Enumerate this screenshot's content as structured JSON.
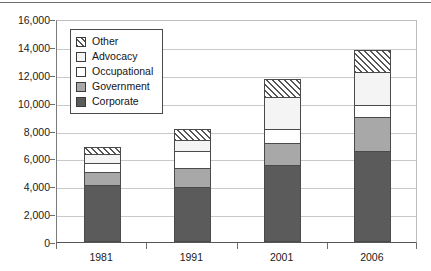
{
  "chart_data": {
    "type": "bar",
    "subtype": "stacked-vertical",
    "title": "",
    "subtitle": "",
    "xlabel": "",
    "ylabel": "",
    "categories": [
      "1981",
      "1991",
      "2001",
      "2006"
    ],
    "ylim": [
      0,
      16000
    ],
    "ytick_values": [
      0,
      2000,
      4000,
      6000,
      8000,
      10000,
      12000,
      14000,
      16000
    ],
    "ytick_labels": [
      "0",
      "2,000",
      "4,000",
      "6,000",
      "8,000",
      "10,000",
      "12,000",
      "14,000",
      "16,000"
    ],
    "grid": true,
    "grid_axis": "y",
    "legend_position": "upper-left-inside",
    "stack_order_bottom_to_top": [
      "Corporate",
      "Government",
      "Occupational",
      "Advocacy",
      "Other"
    ],
    "series": [
      {
        "name": "Corporate",
        "pattern": "solid",
        "color": "#5b5b5b",
        "values": [
          4100,
          3950,
          5500,
          6500
        ]
      },
      {
        "name": "Government",
        "pattern": "solid",
        "color": "#a8a8a8",
        "values": [
          900,
          1350,
          1600,
          2500
        ]
      },
      {
        "name": "Occupational",
        "pattern": "solid",
        "color": "#ffffff",
        "values": [
          700,
          1250,
          1000,
          800
        ]
      },
      {
        "name": "Advocacy",
        "pattern": "solid",
        "color": "#f4f4f4",
        "values": [
          600,
          800,
          2300,
          2400
        ]
      },
      {
        "name": "Other",
        "pattern": "diagonal-hatch",
        "color": "#ffffff",
        "values": [
          500,
          750,
          1300,
          1600
        ]
      }
    ],
    "totals": [
      6800,
      8100,
      11700,
      13800
    ]
  },
  "legend": {
    "items": [
      {
        "label": "Other",
        "swatch": "other-swatch"
      },
      {
        "label": "Advocacy",
        "swatch": "advocacy-swatch"
      },
      {
        "label": "Occupational",
        "swatch": "occupational-swatch"
      },
      {
        "label": "Government",
        "swatch": "government-swatch"
      },
      {
        "label": "Corporate",
        "swatch": "corporate-swatch"
      }
    ]
  }
}
